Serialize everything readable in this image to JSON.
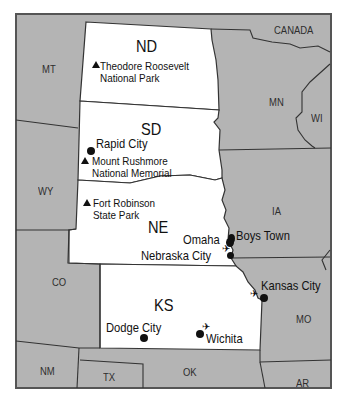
{
  "map": {
    "colors": {
      "featured_states": "#ffffff",
      "other_states": "#b4b4b4",
      "border": "#3a3a3a",
      "frame": "#555555"
    },
    "featured_states": [
      {
        "abbr": "ND"
      },
      {
        "abbr": "SD"
      },
      {
        "abbr": "NE"
      },
      {
        "abbr": "KS"
      }
    ],
    "other_regions": [
      {
        "abbr": "MT"
      },
      {
        "abbr": "WY"
      },
      {
        "abbr": "CO"
      },
      {
        "abbr": "NM"
      },
      {
        "abbr": "TX"
      },
      {
        "abbr": "OK"
      },
      {
        "abbr": "AR"
      },
      {
        "abbr": "MO"
      },
      {
        "abbr": "IA"
      },
      {
        "abbr": "MN"
      },
      {
        "abbr": "WI"
      },
      {
        "abbr": "CANADA"
      }
    ],
    "parks": [
      {
        "name_line1": "Theodore Roosevelt",
        "name_line2": "National Park",
        "icon": "triangle-park-icon"
      },
      {
        "name_line1": "Mount Rushmore",
        "name_line2": "National Memorial",
        "icon": "triangle-park-icon"
      },
      {
        "name_line1": "Fort Robinson",
        "name_line2": "State Park",
        "icon": "triangle-park-icon"
      }
    ],
    "cities": [
      {
        "name": "Rapid City",
        "icon": "city-dot-icon"
      },
      {
        "name": "Omaha",
        "icon": "city-dot-icon",
        "airport": true
      },
      {
        "name": "Boys Town",
        "icon": "city-dot-icon"
      },
      {
        "name": "Nebraska City",
        "icon": "city-dot-icon"
      },
      {
        "name": "Kansas City",
        "icon": "city-dot-icon",
        "airport": true
      },
      {
        "name": "Dodge City",
        "icon": "city-dot-icon"
      },
      {
        "name": "Wichita",
        "icon": "city-dot-icon",
        "airport": true
      }
    ],
    "airport_glyph": "✈"
  }
}
